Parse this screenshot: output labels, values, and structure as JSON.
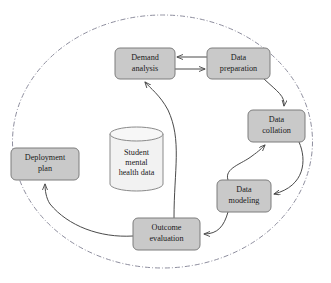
{
  "diagram": {
    "boundary": {
      "label": "system-boundary",
      "shape": "ellipse",
      "line_style": "dash-dot",
      "color": "#8e8e9e"
    },
    "colors": {
      "node_fill": "#c9c9c9",
      "node_stroke": "#7d7d7d",
      "store_fill": "#f2f2f2",
      "store_stroke": "#8a8a8a",
      "arrow": "#4a4a4a",
      "boundary": "#8e8e9e",
      "text": "#1a1a1a",
      "background": "#ffffff"
    },
    "nodes": [
      {
        "id": "demand-analysis",
        "lines": [
          "Demand",
          "analysis"
        ],
        "shape": "rounded-rect",
        "x": 115,
        "y": 48,
        "w": 60,
        "h": 31
      },
      {
        "id": "data-preparation",
        "lines": [
          "Data",
          "preparation"
        ],
        "shape": "rounded-rect",
        "x": 207,
        "y": 48,
        "w": 63,
        "h": 31
      },
      {
        "id": "data-collation",
        "lines": [
          "Data",
          "collation"
        ],
        "shape": "rounded-rect",
        "x": 248,
        "y": 110,
        "w": 57,
        "h": 32
      },
      {
        "id": "data-modeling",
        "lines": [
          "Data",
          "modeling"
        ],
        "shape": "rounded-rect",
        "x": 217,
        "y": 180,
        "w": 54,
        "h": 32
      },
      {
        "id": "outcome-evaluation",
        "lines": [
          "Outcome",
          "evaluation"
        ],
        "shape": "rounded-rect",
        "x": 133,
        "y": 218,
        "w": 67,
        "h": 32
      },
      {
        "id": "deployment-plan",
        "lines": [
          "Deployment",
          "plan"
        ],
        "shape": "rounded-rect",
        "x": 11,
        "y": 148,
        "w": 68,
        "h": 32
      }
    ],
    "data_store": {
      "id": "student-mental-health-data",
      "lines": [
        "Student",
        "mental",
        "health data"
      ],
      "shape": "cylinder",
      "x": 110,
      "y": 128,
      "w": 53,
      "h": 62
    },
    "edges": [
      {
        "id": "data-preparation-to-demand-analysis",
        "from": "data-preparation",
        "to": "demand-analysis",
        "style": "straight",
        "direction": "left"
      },
      {
        "id": "demand-analysis-to-data-preparation",
        "from": "demand-analysis",
        "to": "data-preparation",
        "style": "straight",
        "direction": "right"
      },
      {
        "id": "data-preparation-to-data-collation",
        "from": "data-preparation",
        "to": "data-collation",
        "style": "curved",
        "direction": "down"
      },
      {
        "id": "data-collation-to-data-modeling",
        "from": "data-collation",
        "to": "data-modeling",
        "style": "curved",
        "direction": "down-left"
      },
      {
        "id": "data-modeling-to-data-collation",
        "from": "data-modeling",
        "to": "data-collation",
        "style": "curved",
        "direction": "up-right"
      },
      {
        "id": "data-modeling-to-outcome-evaluation",
        "from": "data-modeling",
        "to": "outcome-evaluation",
        "style": "curved",
        "direction": "left"
      },
      {
        "id": "outcome-evaluation-to-demand-analysis",
        "from": "outcome-evaluation",
        "to": "demand-analysis",
        "style": "curved",
        "direction": "up"
      },
      {
        "id": "outcome-evaluation-to-deployment-plan",
        "from": "outcome-evaluation",
        "to": "deployment-plan",
        "style": "curved",
        "direction": "up-left"
      }
    ]
  }
}
